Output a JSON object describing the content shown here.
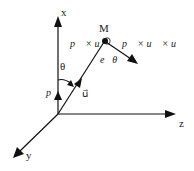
{
  "diagram": {
    "axes": {
      "x_label": "x",
      "y_label": "y",
      "z_label": "z"
    },
    "point_label": "M",
    "vectors": {
      "p": "p⃗",
      "u": "u⃗",
      "p_cross_u": "p⃗ × u⃗",
      "p_cross_u_cross_u": "p⃗ × u⃗ × u⃗",
      "e_theta": "e⃗θ"
    },
    "angle_label": "θ"
  }
}
